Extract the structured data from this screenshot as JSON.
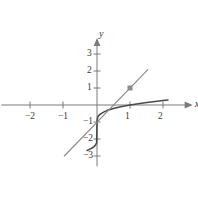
{
  "figure": {
    "kind": "cartesian-plot",
    "width": 198,
    "height": 198,
    "background": "#ffffff"
  },
  "axes": {
    "x_axis_label": "x",
    "y_axis_label": "y",
    "axis_color": "#7a7a7a",
    "label_color": "#3a3a3a",
    "x_ticks": [
      {
        "value": -2,
        "label": "−2",
        "px": 30
      },
      {
        "value": -1,
        "label": "−1",
        "px": 63
      },
      {
        "value": 1,
        "label": "1",
        "px": 130
      },
      {
        "value": 2,
        "label": "2",
        "px": 163
      }
    ],
    "y_ticks": [
      {
        "value": 3,
        "label": "3",
        "px": 54
      },
      {
        "value": 2,
        "label": "2",
        "px": 71
      },
      {
        "value": 1,
        "label": "1",
        "px": 88
      },
      {
        "value": -1,
        "label": "−1",
        "px": 122
      },
      {
        "value": -2,
        "label": "−2",
        "px": 139
      },
      {
        "value": -3,
        "label": "−3",
        "px": 156
      }
    ],
    "origin_px": {
      "x": 97,
      "y": 105
    },
    "unit_px": {
      "x": 33,
      "y": 17
    },
    "xlim": [
      -2.9,
      2.9
    ],
    "ylim": [
      -3.6,
      4.0
    ],
    "grid": false
  },
  "chart_data": {
    "type": "line",
    "title": "",
    "xlabel": "x",
    "ylabel": "y",
    "xlim": [
      -2.9,
      2.9
    ],
    "ylim": [
      -3.6,
      4.0
    ],
    "grid": false,
    "legend": "none",
    "series": [
      {
        "name": "curve",
        "expression": "y = x^(1/3) - 1",
        "color": "#4a4a4a",
        "width": 1.6,
        "x": [
          -0.3,
          -0.25,
          -0.2,
          -0.15,
          -0.1,
          -0.06,
          -0.03,
          -0.01,
          0.0,
          0.02,
          0.05,
          0.1,
          0.2,
          0.3,
          0.4,
          0.5,
          0.65,
          0.8,
          1.0,
          1.2,
          1.45,
          1.7,
          2.0,
          2.15
        ],
        "y": [
          -2.67,
          -2.63,
          -2.58,
          -2.53,
          -2.46,
          -2.39,
          -2.31,
          -2.22,
          -1.0,
          -0.73,
          -0.63,
          -0.54,
          -0.42,
          -0.33,
          -0.26,
          -0.21,
          -0.13,
          -0.07,
          0.0,
          0.06,
          0.13,
          0.19,
          0.26,
          0.29
        ]
      },
      {
        "name": "secant-line",
        "expression": "straight line through (0,-1) and (1,1)",
        "color": "#8a8a8a",
        "width": 1.1,
        "x": [
          -0.99,
          1.54
        ],
        "y": [
          -3.0,
          2.08
        ]
      }
    ],
    "points": [
      {
        "name": "marked-point",
        "x": 1,
        "y": 1,
        "marker": "square",
        "color": "#8c8c8c",
        "size_px": 5
      }
    ]
  }
}
